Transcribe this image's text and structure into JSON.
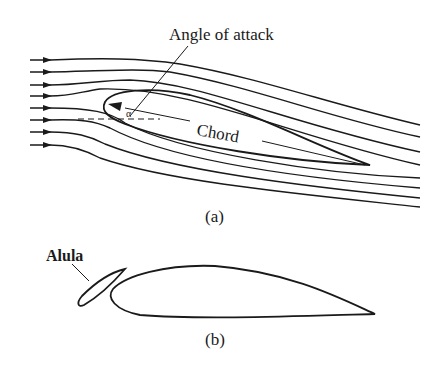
{
  "figure_a": {
    "caption": "(a)",
    "labels": {
      "angle_of_attack": "Angle of attack",
      "chord": "Chord"
    },
    "angle_symbol": "α",
    "streamline_count": 8
  },
  "figure_b": {
    "caption": "(b)",
    "labels": {
      "alula": "Alula"
    }
  },
  "colors": {
    "ink": "#1a1a1a",
    "background": "#ffffff"
  }
}
